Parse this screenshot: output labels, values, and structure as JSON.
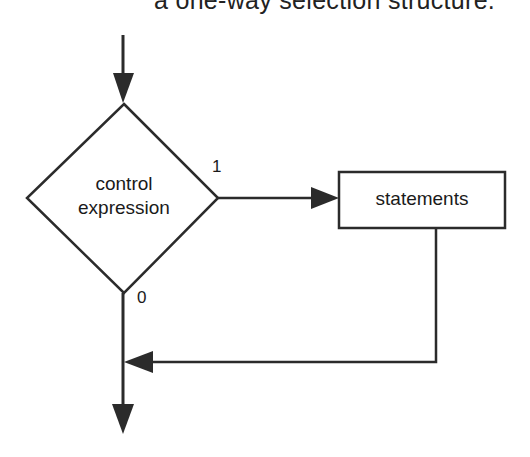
{
  "caption": "a one-way selection structure.",
  "diagram": {
    "decision": {
      "line1": "control",
      "line2": "expression"
    },
    "process": {
      "label": "statements"
    },
    "branch_true_label": "1",
    "branch_false_label": "0"
  },
  "colors": {
    "stroke": "#2b2b2b",
    "background": "#ffffff"
  }
}
